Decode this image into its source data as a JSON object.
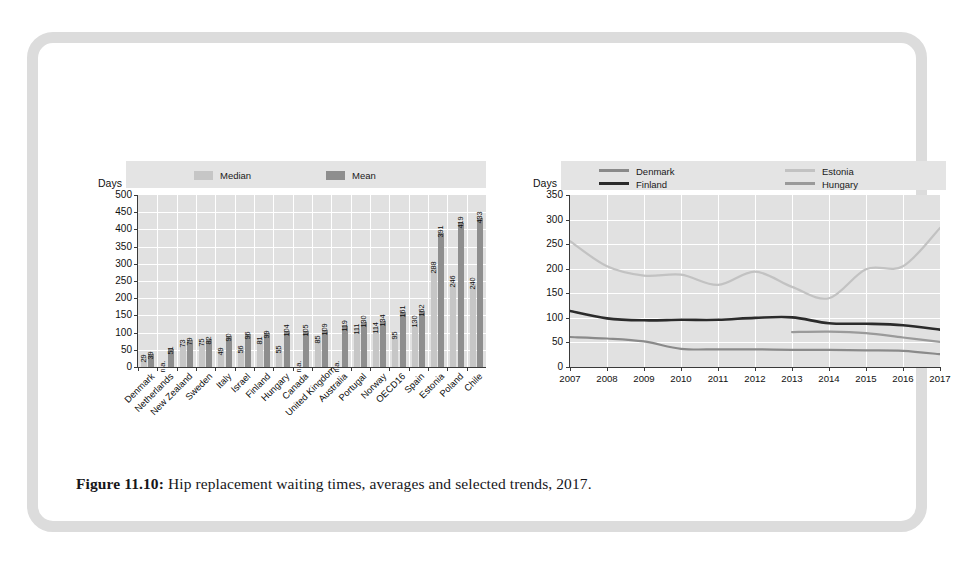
{
  "figure": {
    "number": "Figure 11.10:",
    "caption": "Hip replacement waiting times, averages and selected trends, 2017."
  },
  "colors": {
    "median": "#c6c6c6",
    "mean": "#8e8e8e",
    "denmark": "#8a8a8a",
    "finland": "#2b2b2b",
    "estonia": "#c2c2c2",
    "hungary": "#9a9a9a",
    "plot_bg": "#e1e1e1",
    "legend_bg": "#e4e4e4",
    "grid": "#ffffff",
    "frame": "#dcdcdc"
  },
  "chart_data": [
    {
      "id": "bar-chart",
      "type": "bar",
      "title": "",
      "xlabel": "",
      "ylabel": "Days",
      "ylim": [
        0,
        500
      ],
      "ytick_step": 50,
      "yticks": [
        0,
        50,
        100,
        150,
        200,
        250,
        300,
        350,
        400,
        450,
        500
      ],
      "grid": true,
      "legend_position": "top",
      "categories": [
        "Denmark",
        "Netherlands",
        "New Zealand",
        "Sweden",
        "Italy",
        "Israel",
        "Finland",
        "Hungary",
        "Canada",
        "United Kingdom",
        "Australia",
        "Portugal",
        "Norway",
        "OECD16",
        "Spain",
        "Estonia",
        "Poland",
        "Chile"
      ],
      "series": [
        {
          "name": "Median",
          "color": "#c6c6c6",
          "values": [
            29,
            null,
            39,
            51,
            73,
            75,
            49,
            56,
            81,
            55,
            null,
            null,
            111,
            114,
            95,
            130,
            246,
            240
          ],
          "labels": [
            "29",
            "n.a.",
            "39",
            "51",
            "73",
            "75",
            "49",
            "56",
            "81",
            "55",
            "105",
            "119",
            "111",
            "114",
            "95",
            "130",
            "246",
            "240"
          ]
        },
        {
          "name": "Mean",
          "color": "#8e8e8e",
          "values": [
            39,
            51,
            73,
            79,
            82,
            90,
            96,
            99,
            104,
            105,
            85,
            109,
            130,
            134,
            161,
            162,
            288,
            391
          ],
          "labels": [
            "39",
            "51",
            "73",
            "79",
            "82",
            "90",
            "96",
            "99",
            "104",
            "105",
            "85",
            "109",
            "130",
            "134",
            "161",
            "162",
            "288",
            "391"
          ]
        }
      ],
      "bars": [
        {
          "category": "Denmark",
          "median": 29,
          "median_label": "29",
          "mean": 39,
          "mean_label": "39"
        },
        {
          "category": "Netherlands",
          "median": null,
          "median_label": "n.a.",
          "mean": 51,
          "mean_label": "51"
        },
        {
          "category": "New Zealand",
          "median": 73,
          "median_label": "73",
          "mean": 79,
          "mean_label": "79"
        },
        {
          "category": "Sweden",
          "median": 75,
          "median_label": "75",
          "mean": 82,
          "mean_label": "82"
        },
        {
          "category": "Italy",
          "median": 49,
          "median_label": "49",
          "mean": 90,
          "mean_label": "90"
        },
        {
          "category": "Israel",
          "median": 56,
          "median_label": "56",
          "mean": 96,
          "mean_label": "96"
        },
        {
          "category": "Finland",
          "median": 81,
          "median_label": "81",
          "mean": 99,
          "mean_label": "99"
        },
        {
          "category": "Hungary",
          "median": 55,
          "median_label": "55",
          "mean": 104,
          "mean_label": "104"
        },
        {
          "category": "Canada",
          "median": null,
          "median_label": "n.a.",
          "mean": 105,
          "mean_label": "105"
        },
        {
          "category": "United Kingdom",
          "median": 85,
          "median_label": "85",
          "mean": 109,
          "mean_label": "109"
        },
        {
          "category": "Australia",
          "median": null,
          "median_label": "n.a.",
          "mean": 119,
          "mean_label": "119"
        },
        {
          "category": "Portugal",
          "median": 111,
          "median_label": "111",
          "mean": 130,
          "mean_label": "130"
        },
        {
          "category": "Norway",
          "median": 114,
          "median_label": "114",
          "mean": 134,
          "mean_label": "134"
        },
        {
          "category": "OECD16",
          "median": 95,
          "median_label": "95",
          "mean": 161,
          "mean_label": "161"
        },
        {
          "category": "Spain",
          "median": 130,
          "median_label": "130",
          "mean": 162,
          "mean_label": "162"
        },
        {
          "category": "Estonia",
          "median": 288,
          "median_label": "288",
          "mean": 391,
          "mean_label": "391"
        },
        {
          "category": "Poland",
          "median": 246,
          "median_label": "246",
          "mean": 419,
          "mean_label": "419"
        },
        {
          "category": "Chile",
          "median": 240,
          "median_label": "240",
          "mean": 433,
          "mean_label": "433"
        }
      ]
    },
    {
      "id": "line-chart",
      "type": "line",
      "title": "",
      "xlabel": "",
      "ylabel": "Days",
      "ylim": [
        0,
        350
      ],
      "ytick_step": 50,
      "yticks": [
        0,
        50,
        100,
        150,
        200,
        250,
        300,
        350
      ],
      "grid": true,
      "legend_position": "top",
      "x": [
        2007,
        2008,
        2009,
        2010,
        2011,
        2012,
        2013,
        2014,
        2015,
        2016,
        2017
      ],
      "xtick_labels": [
        "2007",
        "2008",
        "2009",
        "2010",
        "2011",
        "2012",
        "2013",
        "2014",
        "2015",
        "2016",
        "2017"
      ],
      "series": [
        {
          "name": "Denmark",
          "color": "#8a8a8a",
          "values": [
            61,
            58,
            52,
            37,
            36,
            36,
            35,
            35,
            34,
            33,
            26
          ]
        },
        {
          "name": "Finland",
          "color": "#2b2b2b",
          "values": [
            114,
            99,
            95,
            96,
            96,
            100,
            101,
            89,
            88,
            85,
            76
          ]
        },
        {
          "name": "Estonia",
          "color": "#c2c2c2",
          "values": [
            256,
            205,
            186,
            188,
            167,
            194,
            163,
            140,
            199,
            205,
            283
          ]
        },
        {
          "name": "Hungary",
          "color": "#9a9a9a",
          "values": [
            null,
            null,
            null,
            null,
            null,
            null,
            71,
            72,
            69,
            60,
            51
          ]
        }
      ]
    }
  ]
}
